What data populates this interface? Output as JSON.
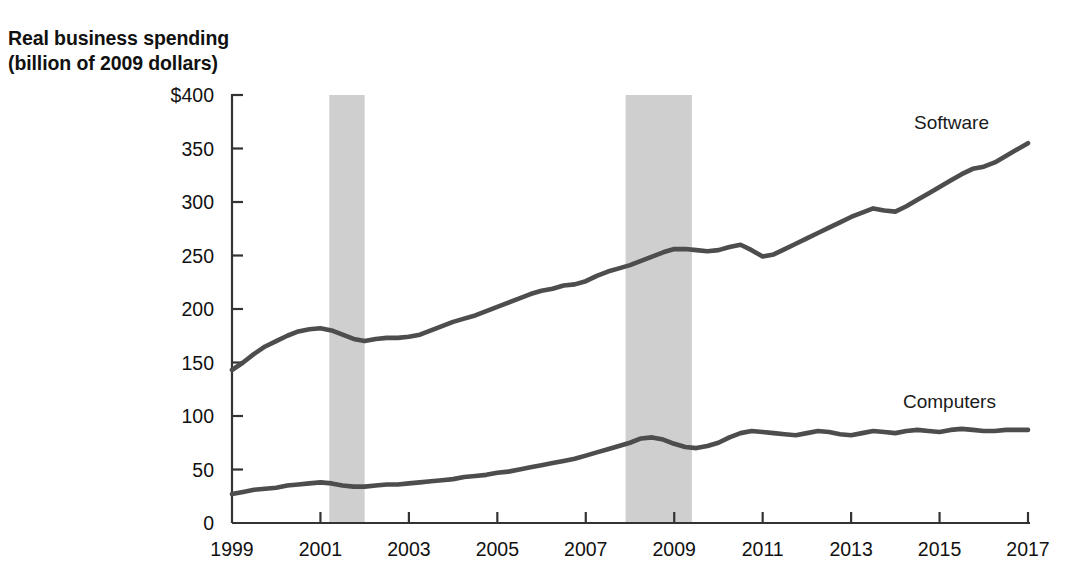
{
  "chart_data": {
    "type": "line",
    "title": "Real business spending\n(billion of 2009 dollars)",
    "xlabel": "",
    "ylabel": "Real business spending (billion of 2009 dollars)",
    "xlim": [
      1999,
      2017
    ],
    "ylim": [
      0,
      400
    ],
    "grid": false,
    "legend_position": "inline-right-of-series",
    "y_ticks": [
      0,
      50,
      100,
      150,
      200,
      250,
      300,
      350,
      400
    ],
    "y_tick_labels": [
      "0",
      "50",
      "100",
      "150",
      "200",
      "250",
      "300",
      "350",
      "$400"
    ],
    "x_ticks": [
      1999,
      2001,
      2003,
      2005,
      2007,
      2009,
      2011,
      2013,
      2015,
      2017
    ],
    "x_tick_labels": [
      "1999",
      "2001",
      "2003",
      "2005",
      "2007",
      "2009",
      "2011",
      "2013",
      "2015",
      "2017"
    ],
    "line_color": "#4d4d4d",
    "shaded_band_color": "#cfcfcf",
    "shaded_bands": [
      {
        "name": "recession-2001",
        "start": 2001.2,
        "end": 2002.0
      },
      {
        "name": "recession-2008",
        "start": 2007.9,
        "end": 2009.4
      }
    ],
    "x": [
      1999.0,
      1999.25,
      1999.5,
      1999.75,
      2000.0,
      2000.25,
      2000.5,
      2000.75,
      2001.0,
      2001.25,
      2001.5,
      2001.75,
      2002.0,
      2002.25,
      2002.5,
      2002.75,
      2003.0,
      2003.25,
      2003.5,
      2003.75,
      2004.0,
      2004.25,
      2004.5,
      2004.75,
      2005.0,
      2005.25,
      2005.5,
      2005.75,
      2006.0,
      2006.25,
      2006.5,
      2006.75,
      2007.0,
      2007.25,
      2007.5,
      2007.75,
      2008.0,
      2008.25,
      2008.5,
      2008.75,
      2009.0,
      2009.25,
      2009.5,
      2009.75,
      2010.0,
      2010.25,
      2010.5,
      2010.75,
      2011.0,
      2011.25,
      2011.5,
      2011.75,
      2012.0,
      2012.25,
      2012.5,
      2012.75,
      2013.0,
      2013.25,
      2013.5,
      2013.75,
      2014.0,
      2014.25,
      2014.5,
      2014.75,
      2015.0,
      2015.25,
      2015.5,
      2015.75,
      2016.0,
      2016.25,
      2016.5,
      2016.75,
      2017.0
    ],
    "series": [
      {
        "name": "Software",
        "label": "Software",
        "color": "#4d4d4d",
        "values": [
          143,
          150,
          158,
          165,
          170,
          175,
          179,
          181,
          182,
          180,
          176,
          172,
          170,
          172,
          173,
          173,
          174,
          176,
          180,
          184,
          188,
          191,
          194,
          198,
          202,
          206,
          210,
          214,
          217,
          219,
          222,
          223,
          226,
          231,
          235,
          238,
          241,
          245,
          249,
          253,
          256,
          256,
          255,
          254,
          255,
          258,
          260,
          255,
          249,
          251,
          256,
          261,
          266,
          271,
          276,
          281,
          286,
          290,
          294,
          292,
          291,
          296,
          302,
          308,
          314,
          320,
          326,
          331,
          333,
          337,
          343,
          349,
          355
        ]
      },
      {
        "name": "Computers",
        "label": "Computers",
        "color": "#4d4d4d",
        "values": [
          27,
          29,
          31,
          32,
          33,
          35,
          36,
          37,
          38,
          37,
          35,
          34,
          34,
          35,
          36,
          36,
          37,
          38,
          39,
          40,
          41,
          43,
          44,
          45,
          47,
          48,
          50,
          52,
          54,
          56,
          58,
          60,
          63,
          66,
          69,
          72,
          75,
          79,
          80,
          78,
          74,
          71,
          70,
          72,
          75,
          80,
          84,
          86,
          85,
          84,
          83,
          82,
          84,
          86,
          85,
          83,
          82,
          84,
          86,
          85,
          84,
          86,
          87,
          86,
          85,
          87,
          88,
          87,
          86,
          86,
          87,
          87,
          87
        ]
      }
    ]
  },
  "labels": {
    "software": "Software",
    "computers": "Computers",
    "y_axis_title": "Real business spending\n(billion of 2009 dollars)"
  }
}
